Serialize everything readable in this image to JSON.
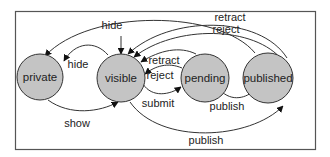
{
  "diagram": {
    "type": "state-diagram",
    "colors": {
      "node_fill": "#c4c4c4",
      "stroke": "#333333",
      "frame": "#555555",
      "background": "#ffffff"
    },
    "nodes": [
      {
        "id": "private",
        "label": "private"
      },
      {
        "id": "visible",
        "label": "visible",
        "initial": true
      },
      {
        "id": "pending",
        "label": "pending"
      },
      {
        "id": "published",
        "label": "published"
      }
    ],
    "edges": [
      {
        "from": "published",
        "to": "private",
        "label": "hide"
      },
      {
        "from": "visible",
        "to": "private",
        "label": "hide"
      },
      {
        "from": "private",
        "to": "visible",
        "label": "show"
      },
      {
        "from": "published",
        "to": "visible",
        "label": "retract"
      },
      {
        "from": "published",
        "to": "visible",
        "label": "reject"
      },
      {
        "from": "pending",
        "to": "visible",
        "label": "retract"
      },
      {
        "from": "pending",
        "to": "visible",
        "label": "reject"
      },
      {
        "from": "visible",
        "to": "pending",
        "label": "submit"
      },
      {
        "from": "pending",
        "to": "published",
        "label": "publish"
      },
      {
        "from": "visible",
        "to": "published",
        "label": "publish"
      }
    ]
  }
}
